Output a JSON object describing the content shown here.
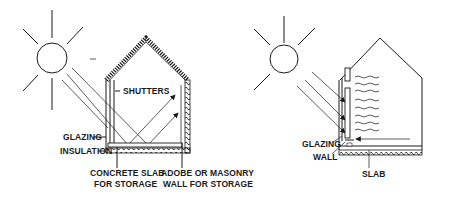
{
  "diagram": {
    "left": {
      "name": "direct-gain solar house",
      "labels": {
        "shutters": "SHUTTERS",
        "glazing": "GLAZING",
        "insulation": "INSULATION",
        "slab_line1": "CONCRETE SLAB",
        "slab_line2": "FOR STORAGE",
        "wall_line1": "ADOBE OR MASONRY",
        "wall_line2": "WALL FOR STORAGE"
      }
    },
    "right": {
      "name": "trombe-wall solar house",
      "labels": {
        "glazing": "GLAZING",
        "wall": "WALL",
        "slab": "SLAB"
      }
    },
    "colors": {
      "ink": "#1a1a1a",
      "background": "#ffffff"
    }
  }
}
